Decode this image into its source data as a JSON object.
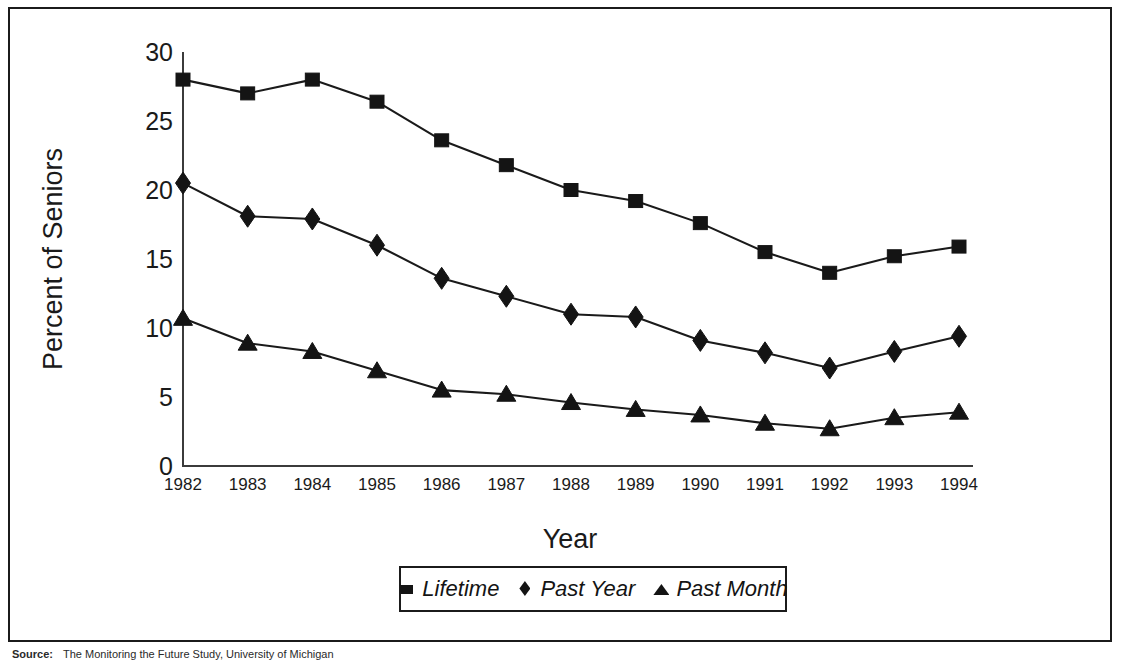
{
  "chart_data": {
    "type": "line",
    "title": "",
    "xlabel": "Year",
    "ylabel": "Percent of Seniors",
    "categories": [
      "1982",
      "1983",
      "1984",
      "1985",
      "1986",
      "1987",
      "1988",
      "1989",
      "1990",
      "1991",
      "1992",
      "1993",
      "1994"
    ],
    "x": [
      1982,
      1983,
      1984,
      1985,
      1986,
      1987,
      1988,
      1989,
      1990,
      1991,
      1992,
      1993,
      1994
    ],
    "ylim": [
      0,
      30
    ],
    "xlim": [
      1982,
      1994
    ],
    "yticks": [
      0,
      5,
      10,
      15,
      20,
      25,
      30
    ],
    "ytick_labels": [
      "0",
      "5",
      "10",
      "15",
      "20",
      "25",
      "30"
    ],
    "grid": false,
    "legend_position": "bottom",
    "series": [
      {
        "name": "Lifetime",
        "marker": "square",
        "values": [
          28.0,
          27.0,
          28.0,
          26.4,
          23.6,
          21.8,
          20.0,
          19.2,
          17.6,
          15.5,
          14.0,
          15.2,
          15.9
        ]
      },
      {
        "name": "Past Year",
        "marker": "diamond",
        "values": [
          20.5,
          18.1,
          17.9,
          16.0,
          13.6,
          12.3,
          11.0,
          10.8,
          9.1,
          8.2,
          7.1,
          8.3,
          9.4
        ]
      },
      {
        "name": "Past Month",
        "marker": "triangle",
        "values": [
          10.7,
          8.9,
          8.3,
          6.9,
          5.5,
          5.2,
          4.6,
          4.1,
          3.7,
          3.1,
          2.7,
          3.5,
          3.9
        ]
      }
    ]
  },
  "legend": {
    "items": [
      {
        "label": "Lifetime",
        "marker": "square"
      },
      {
        "label": "Past Year",
        "marker": "diamond"
      },
      {
        "label": "Past Month",
        "marker": "triangle"
      }
    ]
  },
  "source": {
    "label": "Source:",
    "text": "The Monitoring the Future Study, University of Michigan"
  },
  "colors": {
    "ink": "#141414",
    "axis": "#3b3b3b",
    "background": "#ffffff"
  }
}
